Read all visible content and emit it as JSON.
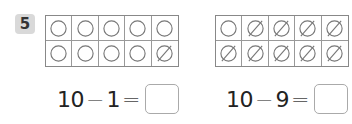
{
  "problem": {
    "number": "5",
    "frames": [
      {
        "name": "left",
        "cells": [
          "circle",
          "circle",
          "circle",
          "circle",
          "circle",
          "circle",
          "circle",
          "circle",
          "circle",
          "crossed"
        ]
      },
      {
        "name": "right",
        "cells": [
          "circle",
          "crossed",
          "crossed",
          "crossed",
          "crossed",
          "crossed",
          "crossed",
          "crossed",
          "crossed",
          "crossed"
        ]
      }
    ],
    "equations": [
      {
        "a": "10",
        "op": "−",
        "b": "1",
        "eq": "=",
        "answer": ""
      },
      {
        "a": "10",
        "op": "−",
        "b": "9",
        "eq": "=",
        "answer": ""
      }
    ]
  },
  "colors": {
    "stroke": "#777777",
    "badge_bg": "#d9d9d9"
  }
}
